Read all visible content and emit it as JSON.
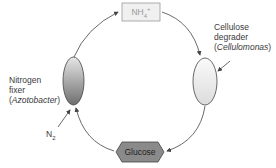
{
  "diagram": {
    "nodes": {
      "ammonium": {
        "label": "NH",
        "sub": "4",
        "sup": "+"
      },
      "glucose": {
        "label": "Glucose"
      },
      "nitrogen_fixer": {
        "line1": "Nitrogen",
        "line2": "fixer",
        "organism": "Azotobacter"
      },
      "cellulose_degrader": {
        "line1": "Cellulose",
        "line2": "degrader",
        "organism": "Cellulomonas"
      },
      "n2_input": {
        "label": "N",
        "sub": "2"
      }
    },
    "edges": [
      {
        "from": "nitrogen_fixer",
        "to": "ammonium"
      },
      {
        "from": "ammonium",
        "to": "cellulose_degrader"
      },
      {
        "from": "cellulose_degrader",
        "to": "glucose"
      },
      {
        "from": "glucose",
        "to": "nitrogen_fixer"
      },
      {
        "from": "n2_input",
        "to": "nitrogen_fixer"
      },
      {
        "from": "cellulose_degrader_label",
        "to": "cellulose_degrader"
      }
    ],
    "colors": {
      "line": "#444444",
      "box_fill": "#f0f0f0",
      "hex_fill": "#8a8a8a",
      "ellipse_light": "#f2f2f2",
      "ellipse_dark": "#7a7a7a"
    }
  }
}
